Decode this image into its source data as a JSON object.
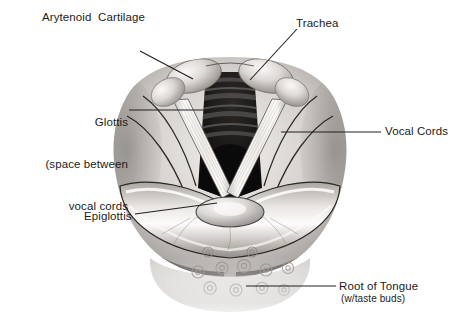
{
  "figure": {
    "background_color": "#ffffff",
    "label_color": "#1b1b1b",
    "leader_line_color": "#202020",
    "width": 460,
    "height": 322
  },
  "labels": {
    "arytenoid": "Arytenoid  Cartilage",
    "glottis_line1": "Glottis",
    "glottis_line2": "(space between",
    "glottis_line3": "vocal cords",
    "trachea": "Trachea",
    "vocal_cords": "Vocal Cords",
    "epiglottis": "Epiglottis",
    "root_of_tongue": "Root of Tongue",
    "root_of_tongue_sub": "(w/taste buds)"
  },
  "leaders": [
    {
      "name": "arytenoid-leader",
      "x1": 140,
      "y1": 51,
      "x2": 193,
      "y2": 79
    },
    {
      "name": "glottis-leader",
      "x1": 129,
      "y1": 110,
      "x2": 238,
      "y2": 110
    },
    {
      "name": "trachea-leader",
      "x1": 297,
      "y1": 29,
      "x2": 250,
      "y2": 80
    },
    {
      "name": "vocal-cords-leader",
      "x1": 381,
      "y1": 132,
      "x2": 281,
      "y2": 132
    },
    {
      "name": "epiglottis-leader",
      "x1": 135,
      "y1": 214,
      "x2": 217,
      "y2": 203
    },
    {
      "name": "root-leader",
      "x1": 336,
      "y1": 286,
      "x2": 246,
      "y2": 286
    }
  ],
  "anatomy": {
    "structures": [
      "arytenoid cartilage",
      "glottis",
      "trachea",
      "vocal cords",
      "epiglottis",
      "root of tongue"
    ],
    "palette": {
      "tissue_light": "#e7e4e0",
      "tissue_mid": "#b3afab",
      "tissue_dark": "#6e6a67",
      "airway_dark": "#141414",
      "cord_white": "#f6f5f2",
      "outline": "#1a1a1a"
    }
  }
}
